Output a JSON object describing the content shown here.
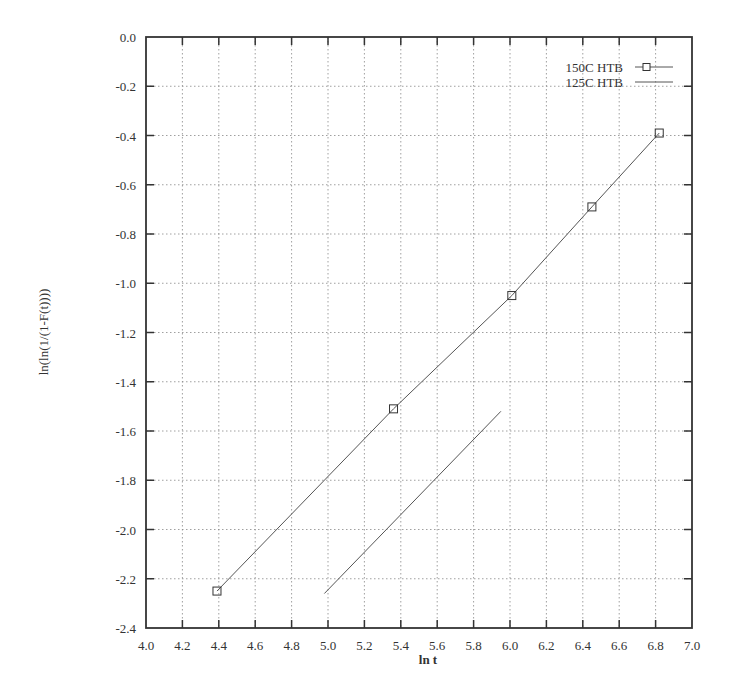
{
  "chart_data": {
    "type": "line",
    "title": "",
    "xlabel": "ln t",
    "ylabel": "ln(ln(1/(1-F(t))))",
    "xlim": [
      4.0,
      7.0
    ],
    "ylim": [
      -2.4,
      0.0
    ],
    "x_ticks": [
      "4.0",
      "4.2",
      "4.4",
      "4.6",
      "4.8",
      "5.0",
      "5.2",
      "5.4",
      "5.6",
      "5.8",
      "6.0",
      "6.2",
      "6.4",
      "6.6",
      "6.8",
      "7.0"
    ],
    "y_ticks": [
      "0.0",
      "-0.2",
      "-0.4",
      "-0.6",
      "-0.8",
      "-1.0",
      "-1.2",
      "-1.4",
      "-1.6",
      "-1.8",
      "-2.0",
      "-2.2",
      "-2.4"
    ],
    "grid": true,
    "legend_position": "top-right",
    "series": [
      {
        "name": "150C HTB",
        "marker": "square",
        "line": true,
        "x": [
          4.39,
          5.36,
          6.01,
          6.45,
          6.82
        ],
        "y": [
          -2.25,
          -1.51,
          -1.05,
          -0.69,
          -0.39
        ]
      },
      {
        "name": "125C HTB",
        "marker": "none",
        "line": true,
        "x": [
          4.98,
          5.95
        ],
        "y": [
          -2.26,
          -1.52
        ]
      }
    ]
  },
  "colors": {
    "frame": "#333333",
    "grid": "#888888",
    "line": "#555555"
  }
}
